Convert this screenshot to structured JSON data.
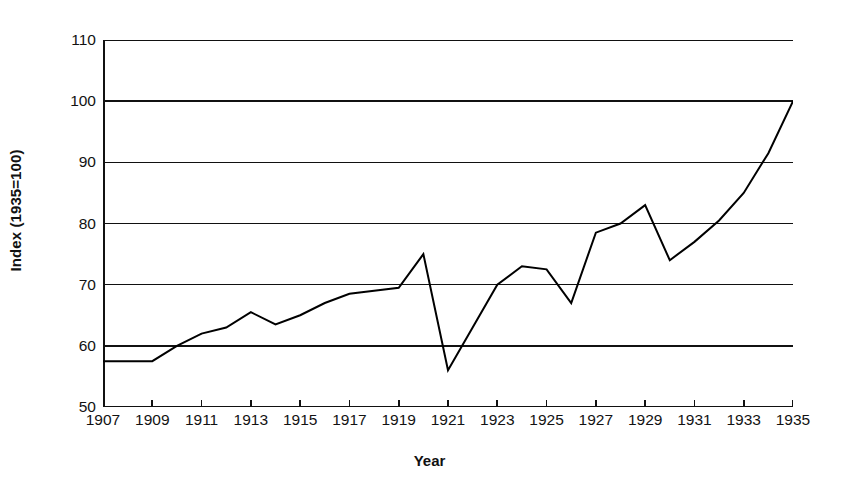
{
  "chart_data": {
    "type": "line",
    "title": "",
    "xlabel": "Year",
    "ylabel": "Index (1935=100)",
    "xlim": [
      1907,
      1935
    ],
    "ylim": [
      50,
      110
    ],
    "ytick_step": 10,
    "xtick_step": 2,
    "grid": "horizontal",
    "legend": "none",
    "line_color": "#000000",
    "line_width_px": 2,
    "background": "#ffffff",
    "yticks": [
      50,
      60,
      70,
      80,
      90,
      100,
      110
    ],
    "ytick_labels": [
      "50",
      "60",
      "70",
      "80",
      "90",
      "100",
      "110"
    ],
    "xticks": [
      1907,
      1909,
      1911,
      1913,
      1915,
      1917,
      1919,
      1921,
      1923,
      1925,
      1927,
      1929,
      1931,
      1933,
      1935
    ],
    "xtick_labels": [
      "1907",
      "1909",
      "1911",
      "1913",
      "1915",
      "1917",
      "1919",
      "1921",
      "1923",
      "1925",
      "1927",
      "1929",
      "1931",
      "1933",
      "1935"
    ],
    "x": [
      1907,
      1908,
      1909,
      1910,
      1911,
      1912,
      1913,
      1914,
      1915,
      1916,
      1917,
      1918,
      1919,
      1920,
      1921,
      1922,
      1923,
      1924,
      1925,
      1926,
      1927,
      1928,
      1929,
      1930,
      1931,
      1932,
      1933,
      1934,
      1935
    ],
    "values": [
      57.5,
      57.5,
      57.5,
      60.0,
      62.0,
      63.0,
      65.5,
      63.5,
      65.0,
      67.0,
      68.5,
      69.0,
      69.5,
      75.0,
      56.0,
      63.0,
      70.0,
      73.0,
      72.5,
      67.0,
      78.5,
      80.0,
      83.0,
      74.0,
      77.0,
      80.5,
      85.0,
      91.5,
      100.0
    ],
    "series": [
      {
        "name": "Index (1935=100)",
        "values": [
          57.5,
          57.5,
          57.5,
          60.0,
          62.0,
          63.0,
          65.5,
          63.5,
          65.0,
          67.0,
          68.5,
          69.0,
          69.5,
          75.0,
          56.0,
          63.0,
          70.0,
          73.0,
          72.5,
          67.0,
          78.5,
          80.0,
          83.0,
          74.0,
          77.0,
          80.5,
          85.0,
          91.5,
          100.0
        ]
      }
    ]
  }
}
